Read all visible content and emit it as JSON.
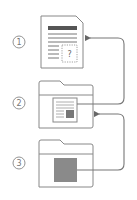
{
  "diagram": {
    "steps": [
      {
        "number": "1",
        "label": "document-with-unknown-content"
      },
      {
        "number": "2",
        "label": "folder-containing-document"
      },
      {
        "number": "3",
        "label": "folder-containing-block"
      }
    ],
    "document": {
      "unknown_marker": "?"
    },
    "arrows": [
      {
        "from": "step-2",
        "to": "step-1"
      },
      {
        "from": "step-3",
        "to": "step-2"
      }
    ],
    "colors": {
      "stroke": "#888888",
      "dark_fill": "#555555",
      "block_fill": "#8a8a8a",
      "background": "#ffffff"
    }
  }
}
